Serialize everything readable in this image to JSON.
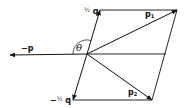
{
  "diagram": {
    "type": "vector-parallelogram",
    "colors": {
      "stroke": "#111111",
      "background": "#ffffff"
    },
    "origin": {
      "x": 87,
      "y": 54
    },
    "vectors": [
      {
        "id": "half_q",
        "label_frac": "½",
        "label_sym": "q",
        "tip": {
          "x": 100,
          "y": 10
        }
      },
      {
        "id": "neg_half_q",
        "label_prefix": "−",
        "label_frac": "½",
        "label_sym": "q",
        "tip": {
          "x": 73,
          "y": 100
        }
      },
      {
        "id": "neg_p",
        "label": "−p",
        "tip": {
          "x": 10,
          "y": 55
        }
      },
      {
        "id": "p1",
        "label_sym": "p",
        "label_sub": "1",
        "tip": {
          "x": 177,
          "y": 10
        }
      },
      {
        "id": "p2",
        "label_sym": "p",
        "label_sub": "2",
        "tip": {
          "x": 152,
          "y": 100
        }
      }
    ],
    "angle_label": "θ"
  },
  "labels": {
    "half_q_frac": "½",
    "half_q_sym": "q",
    "neg_half_q_prefix": "−",
    "neg_half_q_frac": "½",
    "neg_half_q_sym": "q",
    "neg_p": "−p",
    "p1_sym": "p",
    "p1_sub": "1",
    "p2_sym": "p",
    "p2_sub": "2",
    "theta": "θ"
  }
}
